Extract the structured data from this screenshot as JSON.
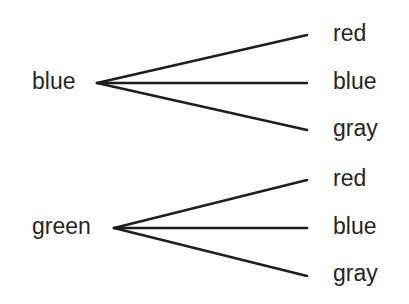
{
  "diagram": {
    "type": "tree",
    "trees": [
      {
        "root": "blue",
        "branches": [
          "red",
          "blue",
          "gray"
        ]
      },
      {
        "root": "green",
        "branches": [
          "red",
          "blue",
          "gray"
        ]
      }
    ]
  },
  "colors": {
    "line": "#1e1e1e",
    "text": "#262626",
    "background": "#ffffff"
  }
}
